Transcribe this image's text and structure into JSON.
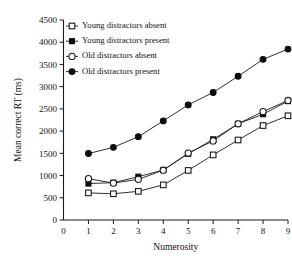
{
  "chart_data": {
    "type": "line",
    "title": "",
    "xlabel": "Numerosity",
    "ylabel": "Mean correct RT (ms)",
    "x": [
      1,
      2,
      3,
      4,
      5,
      6,
      7,
      8,
      9
    ],
    "xlim": [
      0,
      9
    ],
    "ylim": [
      0,
      4500
    ],
    "xticks": [
      0,
      1,
      2,
      3,
      4,
      5,
      6,
      7,
      8,
      9
    ],
    "yticks": [
      0,
      500,
      1000,
      1500,
      2000,
      2500,
      3000,
      3500,
      4000,
      4500
    ],
    "grid": false,
    "legend_position": "upper-left-inside",
    "series": [
      {
        "name": "Young distractors absent",
        "marker": "open-square",
        "values": [
          610,
          590,
          645,
          790,
          1115,
          1465,
          1800,
          2125,
          2345
        ]
      },
      {
        "name": "Young distractors present",
        "marker": "filled-square",
        "values": [
          820,
          840,
          975,
          1125,
          1490,
          1815,
          2165,
          2380,
          2675
        ]
      },
      {
        "name": "Old distractors absent",
        "marker": "open-circle",
        "values": [
          930,
          830,
          915,
          1120,
          1505,
          1780,
          2165,
          2440,
          2690
        ]
      },
      {
        "name": "Old distractors present",
        "marker": "filled-circle",
        "values": [
          1495,
          1635,
          1875,
          2230,
          2590,
          2870,
          3235,
          3615,
          3845
        ]
      }
    ]
  },
  "colors": {
    "ink": "#111111",
    "marker_fill": "#0d0d0d",
    "marker_open": "#ffffff",
    "background": "#ffffff"
  },
  "axis": {
    "x_tick_labels": [
      "0",
      "1",
      "2",
      "3",
      "4",
      "5",
      "6",
      "7",
      "8",
      "9"
    ],
    "y_tick_labels": [
      "0",
      "500",
      "1000",
      "1500",
      "2000",
      "2500",
      "3000",
      "3500",
      "4000",
      "4500"
    ]
  }
}
